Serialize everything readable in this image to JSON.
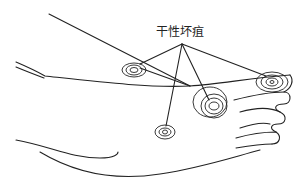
{
  "figure": {
    "type": "medical-illustration",
    "label": "干性坏疽",
    "colors": {
      "ink": "#222222",
      "background": "#ffffff"
    },
    "lesions": [
      {
        "name": "ankle-lesion",
        "cx": 134,
        "cy": 70
      },
      {
        "name": "midfoot-lesion",
        "cx": 214,
        "cy": 105
      },
      {
        "name": "big-toe-lesion",
        "cx": 271,
        "cy": 82
      },
      {
        "name": "sole-lesion",
        "cx": 165,
        "cy": 132
      }
    ]
  }
}
